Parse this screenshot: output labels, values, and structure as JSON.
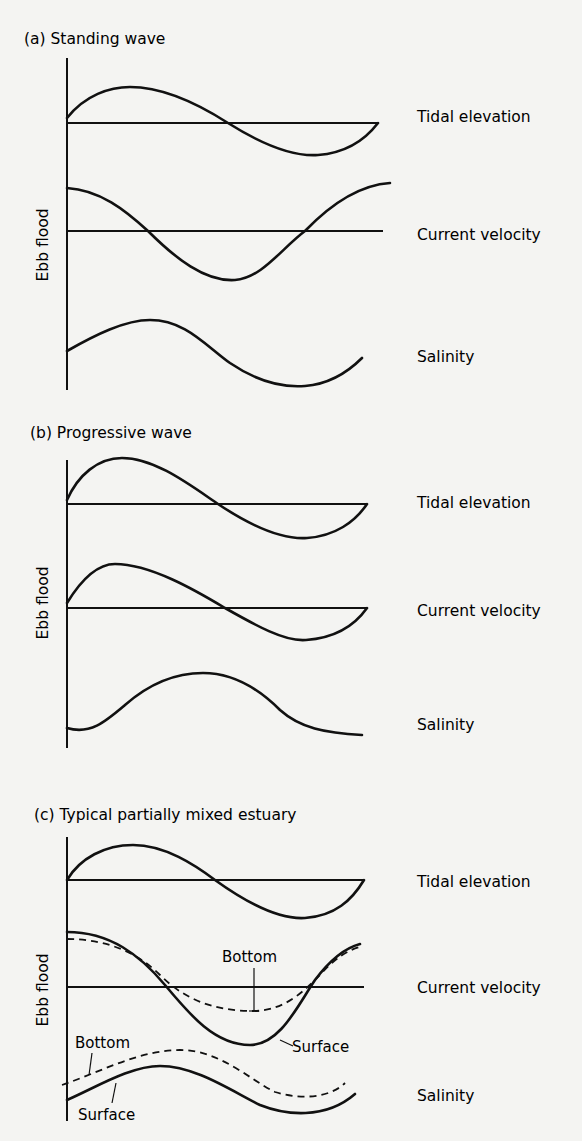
{
  "figure": {
    "panels": [
      {
        "title": "(a) Standing wave",
        "y_axis_label": "Ebb flood",
        "series": [
          {
            "label": "Tidal elevation"
          },
          {
            "label": "Current velocity"
          },
          {
            "label": "Salinity"
          }
        ]
      },
      {
        "title": "(b) Progressive wave",
        "y_axis_label": "Ebb flood",
        "series": [
          {
            "label": "Tidal elevation"
          },
          {
            "label": "Current velocity"
          },
          {
            "label": "Salinity"
          }
        ]
      },
      {
        "title": "(c) Typical partially mixed estuary",
        "y_axis_label": "Ebb flood",
        "series": [
          {
            "label": "Tidal elevation"
          },
          {
            "label": "Current velocity"
          },
          {
            "label": "Salinity"
          }
        ],
        "annotations": {
          "velocity_bottom": "Bottom",
          "velocity_surface": "Surface",
          "salinity_bottom": "Bottom",
          "salinity_surface": "Surface"
        }
      }
    ]
  }
}
